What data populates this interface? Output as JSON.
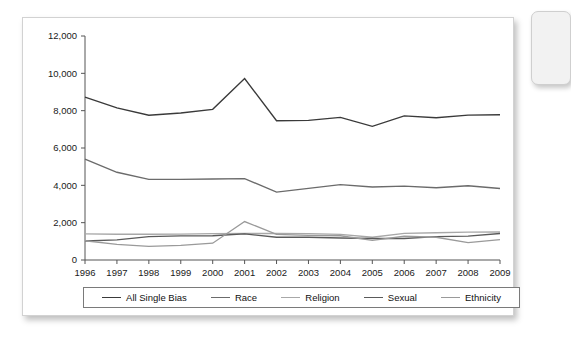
{
  "card": {
    "peek_card_name": "adjacent-partial-card"
  },
  "chart_data": {
    "type": "line",
    "title": "",
    "subtitle": "",
    "xlabel": "",
    "ylabel": "",
    "x": [
      1996,
      1997,
      1998,
      1999,
      2000,
      2001,
      2002,
      2003,
      2004,
      2005,
      2006,
      2007,
      2008,
      2009
    ],
    "categories": [
      "1996",
      "1997",
      "1998",
      "1999",
      "2000",
      "2001",
      "2002",
      "2003",
      "2004",
      "2005",
      "2006",
      "2007",
      "2008",
      "2009"
    ],
    "ylim": [
      0,
      12000
    ],
    "yticks": [
      0,
      2000,
      4000,
      6000,
      8000,
      10000,
      12000
    ],
    "ytick_labels": [
      "0",
      "2,000",
      "4,000",
      "6,000",
      "8,000",
      "10,000",
      "12,000"
    ],
    "grid": false,
    "legend_position": "bottom",
    "series": [
      {
        "name": "All Single Bias",
        "color": "#3a3a3a",
        "values": [
          8730,
          8150,
          7755,
          7875,
          8070,
          9720,
          7460,
          7480,
          7640,
          7160,
          7720,
          7620,
          7760,
          7780
        ]
      },
      {
        "name": "Race",
        "color": "#6b6b6b",
        "values": [
          5400,
          4700,
          4320,
          4320,
          4340,
          4360,
          3640,
          3840,
          4040,
          3910,
          3960,
          3870,
          3980,
          3830
        ]
      },
      {
        "name": "Religion",
        "color": "#a8a8a8",
        "values": [
          1400,
          1380,
          1380,
          1390,
          1410,
          1420,
          1420,
          1410,
          1370,
          1220,
          1430,
          1460,
          1490,
          1500
        ]
      },
      {
        "name": "Sexual",
        "color": "#5a5a5a",
        "values": [
          1020,
          1080,
          1250,
          1290,
          1300,
          1400,
          1220,
          1220,
          1180,
          1150,
          1150,
          1250,
          1280,
          1420
        ]
      },
      {
        "name": "Ethnicity",
        "color": "#9a9a9a",
        "values": [
          1030,
          840,
          730,
          780,
          900,
          2060,
          1370,
          1320,
          1300,
          1050,
          1270,
          1220,
          930,
          1090
        ]
      }
    ]
  },
  "legend": {
    "items": [
      {
        "label": "All Single Bias",
        "color": "#3a3a3a"
      },
      {
        "label": "Race",
        "color": "#6b6b6b"
      },
      {
        "label": "Religion",
        "color": "#a8a8a8"
      },
      {
        "label": "Sexual",
        "color": "#5a5a5a"
      },
      {
        "label": "Ethnicity",
        "color": "#9a9a9a"
      }
    ]
  }
}
